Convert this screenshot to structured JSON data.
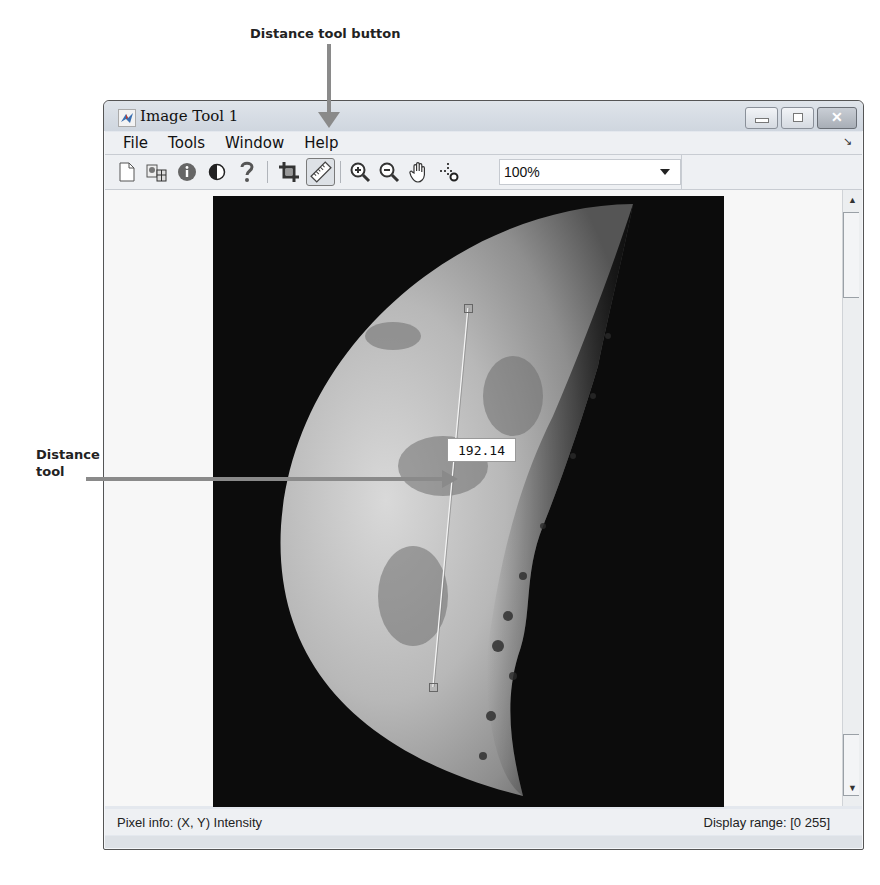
{
  "annotations": {
    "top_label": "Distance tool button",
    "left_label_line1": "Distance",
    "left_label_line2": "tool",
    "arrow_color": "#8a8a8a"
  },
  "window": {
    "title": "Image Tool 1",
    "controls": {
      "minimize": "minimize",
      "maximize": "maximize",
      "close": "✕"
    }
  },
  "menubar": {
    "items": [
      {
        "label": "File"
      },
      {
        "label": "Tools"
      },
      {
        "label": "Window"
      },
      {
        "label": "Help"
      }
    ],
    "dock_glyph": "↘"
  },
  "toolbar": {
    "buttons": [
      {
        "name": "new-figure",
        "icon": "new-document-icon"
      },
      {
        "name": "export-image",
        "icon": "export-icon"
      },
      {
        "name": "image-information",
        "icon": "info-icon"
      },
      {
        "name": "adjust-contrast",
        "icon": "contrast-icon"
      },
      {
        "name": "help",
        "icon": "help-icon"
      },
      {
        "name": "crop-image",
        "icon": "crop-icon"
      },
      {
        "name": "distance-tool",
        "icon": "ruler-icon",
        "active": true
      },
      {
        "name": "zoom-in",
        "icon": "zoom-in-icon"
      },
      {
        "name": "zoom-out",
        "icon": "zoom-out-icon"
      },
      {
        "name": "pan",
        "icon": "hand-icon"
      },
      {
        "name": "pixel-region",
        "icon": "pixel-region-icon"
      }
    ],
    "zoom_value": "100%"
  },
  "image_view": {
    "distance_value": "192.14",
    "line_start": {
      "x": 255,
      "y": 112
    },
    "line_end": {
      "x": 220,
      "y": 491
    }
  },
  "statusbar": {
    "pixel_info": "Pixel info: (X, Y)  Intensity",
    "display_range": "Display range: [0 255]"
  }
}
